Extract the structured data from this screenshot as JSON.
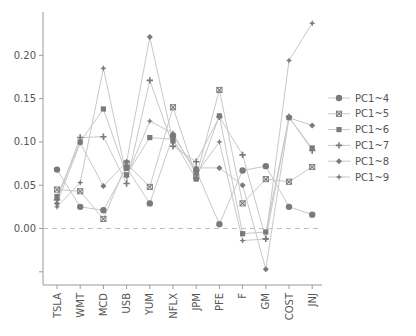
{
  "chart_data": {
    "type": "line",
    "title": "",
    "xlabel": "",
    "ylabel": "",
    "categories": [
      "TSLA",
      "WMT",
      "MCD",
      "USB",
      "YUM",
      "NFLX",
      "JPM",
      "PFE",
      "F",
      "GM",
      "COST",
      "JNJ"
    ],
    "yticks": [
      {
        "value": 0.2,
        "label": "0.20"
      },
      {
        "value": 0.15,
        "label": "0.15"
      },
      {
        "value": 0.1,
        "label": "0.10"
      },
      {
        "value": 0.05,
        "label": "0.05"
      },
      {
        "value": 0.0,
        "label": "0.00"
      },
      {
        "value": -0.05,
        "label": ""
      }
    ],
    "ylim": [
      -0.072,
      0.245
    ],
    "zero_line": "dashed",
    "grid": false,
    "legend_position": "right",
    "series": [
      {
        "name": "PC1~4",
        "marker": "circle",
        "values": [
          0.068,
          0.025,
          0.021,
          0.07,
          0.029,
          0.107,
          0.067,
          0.005,
          0.067,
          0.072,
          0.025,
          0.016
        ]
      },
      {
        "name": "PC1~5",
        "marker": "x",
        "values": [
          0.045,
          0.043,
          0.011,
          0.075,
          0.048,
          0.14,
          0.06,
          0.16,
          0.029,
          0.057,
          0.054,
          0.071
        ]
      },
      {
        "name": "PC1~6",
        "marker": "square",
        "values": [
          0.037,
          0.1,
          0.138,
          0.062,
          0.105,
          0.103,
          0.057,
          0.13,
          -0.006,
          -0.004,
          0.128,
          0.093
        ]
      },
      {
        "name": "PC1~7",
        "marker": "plus",
        "values": [
          0.033,
          0.105,
          0.106,
          0.052,
          0.171,
          0.095,
          0.077,
          0.129,
          0.085,
          -0.012,
          0.129,
          0.09
        ]
      },
      {
        "name": "PC1~8",
        "marker": "diamond",
        "values": [
          0.029,
          0.099,
          0.049,
          0.077,
          0.221,
          0.1,
          0.07,
          0.07,
          0.05,
          -0.047,
          0.128,
          0.119
        ]
      },
      {
        "name": "PC1~9",
        "marker": "star",
        "values": [
          0.025,
          0.053,
          0.185,
          0.06,
          0.124,
          0.11,
          0.063,
          0.1,
          -0.014,
          -0.012,
          0.194,
          0.237
        ]
      }
    ],
    "colors": {
      "line": "#c8c8c8",
      "marker": "#7a7a7a",
      "axis": "#9a9a9a",
      "zero_line": "#c0c0c0",
      "text": "#555555"
    }
  }
}
